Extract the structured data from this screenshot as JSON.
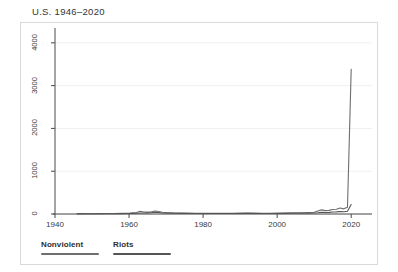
{
  "chart_data": {
    "type": "line",
    "title": "U.S. 1946–2020",
    "xlabel": "",
    "ylabel": "",
    "xlim": [
      1940,
      2024
    ],
    "ylim": [
      0,
      4300
    ],
    "grid": true,
    "grid_axis": "y",
    "legend_position": "below-left",
    "xticks": [
      1940,
      1960,
      1980,
      2000,
      2020
    ],
    "xtick_labels": [
      "1940",
      "1960",
      "1980",
      "2000",
      "2020"
    ],
    "yticks": [
      0,
      1000,
      2000,
      3000,
      4000
    ],
    "ytick_labels": [
      "0",
      "1000",
      "2000",
      "3000",
      "4000"
    ],
    "x": [
      1946,
      1948,
      1950,
      1952,
      1954,
      1956,
      1958,
      1960,
      1961,
      1962,
      1963,
      1964,
      1965,
      1966,
      1967,
      1968,
      1969,
      1970,
      1972,
      1974,
      1976,
      1978,
      1980,
      1982,
      1984,
      1986,
      1988,
      1990,
      1992,
      1994,
      1996,
      1998,
      2000,
      2002,
      2004,
      2006,
      2008,
      2010,
      2011,
      2012,
      2013,
      2014,
      2015,
      2016,
      2017,
      2018,
      2019,
      2020
    ],
    "series": [
      {
        "name": "Nonviolent",
        "color": "#6e6e6e",
        "values": [
          6,
          8,
          7,
          9,
          10,
          12,
          14,
          18,
          26,
          34,
          62,
          48,
          44,
          52,
          70,
          58,
          40,
          34,
          26,
          22,
          20,
          18,
          18,
          16,
          16,
          18,
          18,
          20,
          22,
          20,
          18,
          18,
          20,
          22,
          26,
          30,
          34,
          42,
          70,
          96,
          78,
          84,
          104,
          112,
          140,
          120,
          160,
          3380
        ]
      },
      {
        "name": "Riots",
        "color": "#555555",
        "values": [
          4,
          5,
          5,
          6,
          6,
          7,
          8,
          10,
          14,
          18,
          24,
          22,
          26,
          30,
          40,
          34,
          24,
          20,
          16,
          14,
          12,
          12,
          12,
          10,
          10,
          12,
          12,
          12,
          14,
          12,
          12,
          12,
          12,
          14,
          16,
          18,
          20,
          24,
          30,
          40,
          34,
          38,
          46,
          50,
          58,
          52,
          66,
          220
        ]
      }
    ]
  },
  "legend": {
    "items": [
      {
        "label": "Nonviolent",
        "color": "#6e6e6e"
      },
      {
        "label": "Riots",
        "color": "#555555"
      }
    ]
  }
}
